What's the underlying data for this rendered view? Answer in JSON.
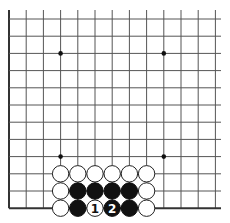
{
  "diagram": {
    "type": "go-board-fragment",
    "corner": "bottom-left",
    "grid": {
      "origin_x": 9,
      "origin_y": 19,
      "spacing": 17.2,
      "columns": 13,
      "rows": 12,
      "right_extent": 221,
      "left_edge_visible": true,
      "bottom_edge_visible": true
    },
    "hoshi": [
      {
        "col": 3,
        "row": 2
      },
      {
        "col": 9,
        "row": 2
      },
      {
        "col": 3,
        "row": 8
      },
      {
        "col": 9,
        "row": 8
      }
    ],
    "stones": [
      {
        "col": 3,
        "row": 9,
        "color": "white"
      },
      {
        "col": 4,
        "row": 9,
        "color": "white"
      },
      {
        "col": 5,
        "row": 9,
        "color": "white"
      },
      {
        "col": 6,
        "row": 9,
        "color": "white"
      },
      {
        "col": 7,
        "row": 9,
        "color": "white"
      },
      {
        "col": 8,
        "row": 9,
        "color": "white"
      },
      {
        "col": 3,
        "row": 10,
        "color": "white"
      },
      {
        "col": 4,
        "row": 10,
        "color": "black"
      },
      {
        "col": 5,
        "row": 10,
        "color": "black"
      },
      {
        "col": 6,
        "row": 10,
        "color": "black"
      },
      {
        "col": 7,
        "row": 10,
        "color": "black"
      },
      {
        "col": 8,
        "row": 10,
        "color": "white"
      },
      {
        "col": 3,
        "row": 11,
        "color": "white"
      },
      {
        "col": 4,
        "row": 11,
        "color": "black"
      },
      {
        "col": 5,
        "row": 11,
        "color": "white",
        "label": "1"
      },
      {
        "col": 6,
        "row": 11,
        "color": "black",
        "label": "2"
      },
      {
        "col": 7,
        "row": 11,
        "color": "black"
      },
      {
        "col": 8,
        "row": 11,
        "color": "white"
      }
    ],
    "colors": {
      "black_stone": "#111111",
      "white_stone": "#ffffff",
      "grid": "#555555",
      "edge": "#333333"
    }
  }
}
